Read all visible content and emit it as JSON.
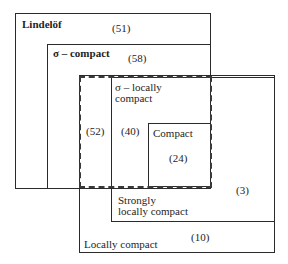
{
  "diagram": {
    "regions": {
      "lindelof": {
        "label": "Lindelöf",
        "count": "(51)"
      },
      "sigma_compact": {
        "label": "σ – compact",
        "count": "(58)"
      },
      "sigma_locally_compact": {
        "label": "σ – locally\ncompact",
        "count_outside_strongly": "(52)",
        "count": "(40)"
      },
      "compact": {
        "label": "Compact",
        "count": "(24)"
      },
      "strongly_locally_compact": {
        "label": "Strongly\nlocally compact",
        "count": "(3)"
      },
      "locally_compact": {
        "label": "Locally compact",
        "count": "(10)"
      }
    }
  }
}
